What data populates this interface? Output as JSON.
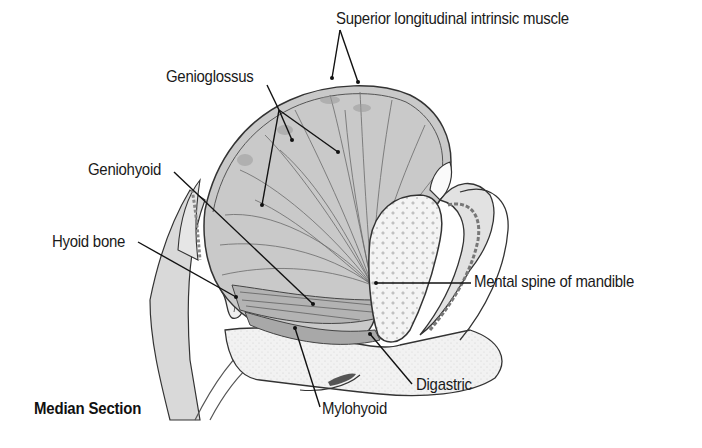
{
  "figure": {
    "caption": "Median Section",
    "labels": [
      {
        "id": "superior-longitudinal",
        "text": "Superior longitudinal intrinsic muscle",
        "x": 336,
        "y": 9
      },
      {
        "id": "genioglossus",
        "text": "Genioglossus",
        "x": 166,
        "y": 67
      },
      {
        "id": "geniohyoid",
        "text": "Geniohyoid",
        "x": 88,
        "y": 160
      },
      {
        "id": "hyoid-bone",
        "text": "Hyoid bone",
        "x": 52,
        "y": 232
      },
      {
        "id": "mental-spine",
        "text": "Mental spine of mandible",
        "x": 474,
        "y": 272
      },
      {
        "id": "digastric",
        "text": "Digastric",
        "x": 416,
        "y": 375
      },
      {
        "id": "mylohyoid",
        "text": "Mylohyoid",
        "x": 322,
        "y": 399
      }
    ]
  }
}
